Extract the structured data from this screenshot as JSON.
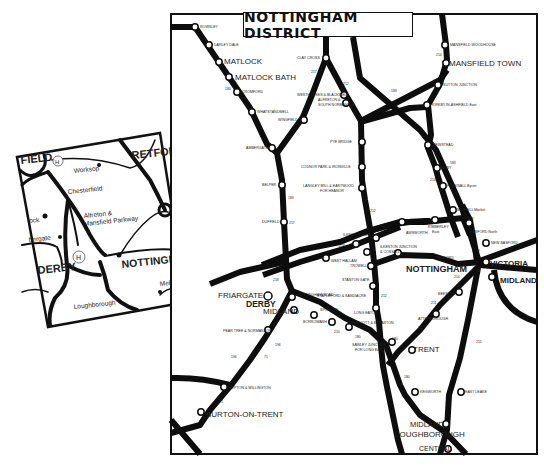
{
  "title": "NOTTINGHAM DISTRICT",
  "colors": {
    "line": "#0d0d0d",
    "station_fill": "#ffffff",
    "background": "#ffffff"
  },
  "stations_major": {
    "matlock": "MATLOCK",
    "matlock_bath": "MATLOCK BATH",
    "mansfield_town": "MANSFIELD TOWN",
    "nottingham": "NOTTINGHAM",
    "victoria": "VICTORIA",
    "midland_nottingham": "MIDLAND",
    "friargate": "FRIARGATE",
    "derby": "DERBY",
    "midland_derby": "MIDLAND",
    "trent": "TRENT",
    "burton": "BURTON-ON-TRENT",
    "midland_lough": "MIDLAND",
    "loughborough": "LOUGHBOROUGH",
    "central": "CENTRAL"
  },
  "stations_minor": {
    "rowsley": "ROWSLEY",
    "darley_dale": "DARLEY DALE",
    "cromford": "CROMFORD",
    "whatstandwell": "WHATSTANDWELL",
    "ambergate": "AMBERGATE",
    "belper": "BELPER",
    "duffield": "DUFFIELD",
    "clay_cross": "CLAY CROSS",
    "westhouses": "WESTHOUSES & BLACKWELL",
    "wingfield": "WINGFIELD",
    "alfreton": "ALFRETON &",
    "alfreton2": "SOUTH NORMANTON",
    "pye_bridge": "PYE BRIDGE",
    "codnor": "CODNOR PARK & IRONVILLE",
    "langley": "LANGLEY MILL & EASTWOOD",
    "langley2": "FOR HEANOR",
    "mansfield_woodhouse": "MANSFIELD WOODHOUSE",
    "sutton_junction": "SUTTON JUNCTION",
    "kirkby": "KIRKBY-IN-ASHFIELD East",
    "newstead": "NEWSTEAD",
    "linby": "LINBY",
    "hucknall": "HUCKNALL Byron",
    "bulwell": "BULWELL Market",
    "kimberley": "KIMBERLEY",
    "kimberley2": "East",
    "awsworth": "AWSWORTH",
    "ilkeston_north": "ILKESTON North",
    "ilkeston_junction": "ILKESTON JUNCTION",
    "ilkeston_junction2": "& COSSALL",
    "basford": "BASFORD North",
    "new_basford": "NEW BASFORD",
    "radford": "RADFORD",
    "west_hallam": "WEST HALLAM",
    "trowell": "TROWELL",
    "stanton_gate": "STANTON GATE",
    "stapleford": "STAPLEFORD & SANDIACRE",
    "long_eaton": "LONG EATON",
    "beeston": "BEESTON",
    "attenborough": "ATTENBOROUGH",
    "nottingham_road": "NOTTINGHAM ROAD",
    "spondon": "SPONDON",
    "borrowash": "BORROWASH",
    "draycott": "DRAYCOTT & BREASTON",
    "sawley": "SAWLEY JUNCTION",
    "sawley2": "FOR LONG EATON",
    "pear_tree": "PEAR TREE & NORMANTON",
    "repton": "REPTON & WILLINGTON",
    "kegworth": "KEGWORTH",
    "east_leake": "EAST LEAKE"
  },
  "route_numbers": [
    "183",
    "217",
    "212",
    "183",
    "214",
    "183",
    "214",
    "212",
    "212",
    "218",
    "183",
    "217",
    "218",
    "218",
    "214",
    "180",
    "211",
    "211",
    "180",
    "212",
    "210",
    "180",
    "196",
    "196",
    "71",
    "71",
    "180",
    "215"
  ],
  "inset_map": {
    "labels": {
      "chesterfield_edge": "FIELD",
      "retford_edge": "RETFOR",
      "worksop": "Worksop",
      "chesterfield": "Chesterfield",
      "alfreton": "Alfreton &",
      "alfreton2": "Mansfield Parkway",
      "matlock_edge": "lock",
      "belper_edge": "bergate",
      "derby": "DERBY",
      "nottingham": "NOTTINGHAM",
      "loughborough": "Loughborough",
      "melton": "Melton",
      "hospital": "H"
    }
  }
}
